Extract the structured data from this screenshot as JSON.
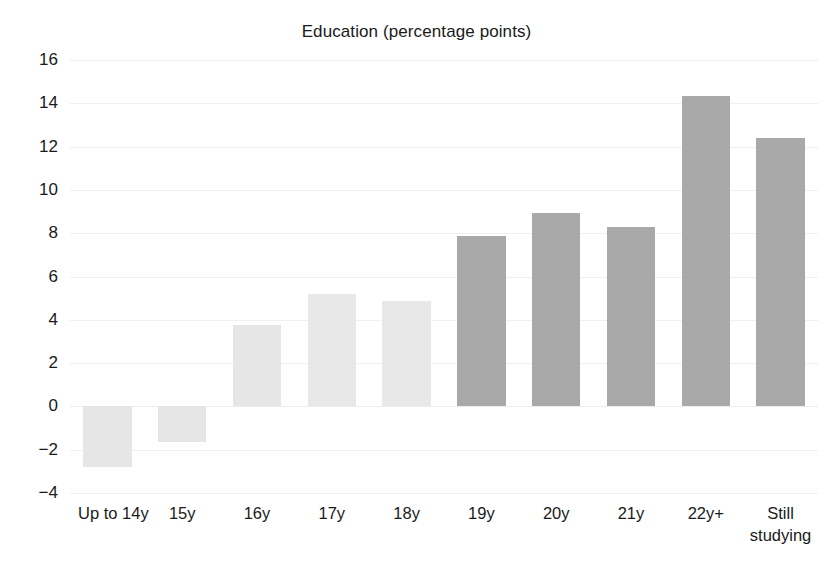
{
  "chart": {
    "title": "Education (percentage points)"
  },
  "axes": {
    "y_tick_labels": [
      "16",
      "14",
      "12",
      "10",
      "8",
      "6",
      "4",
      "2",
      "0",
      "−2",
      "−4"
    ]
  },
  "colors": {
    "bar_light": "#e6e6e6",
    "bar_dark": "#a9a9a9",
    "gridline": "#f0f0f0",
    "text": "#1a1a1a",
    "background": "#ffffff"
  },
  "chart_data": {
    "type": "bar",
    "title": "Education (percentage points)",
    "xlabel": "",
    "ylabel": "",
    "ylim": [
      -4,
      16
    ],
    "yticks": [
      -4,
      -2,
      0,
      2,
      4,
      6,
      8,
      10,
      12,
      14,
      16
    ],
    "grid": true,
    "legend": null,
    "categories": [
      "Up to 14y",
      "15y",
      "16y",
      "17y",
      "18y",
      "19y",
      "20y",
      "21y",
      "22y+",
      "Still studying"
    ],
    "values": [
      -2.8,
      -1.65,
      3.75,
      5.2,
      4.85,
      7.85,
      8.95,
      8.3,
      14.35,
      12.4
    ],
    "bar_colors": [
      "#e6e6e6",
      "#e6e6e6",
      "#e6e6e6",
      "#e8e8e8",
      "#e8e8e8",
      "#a9a9a9",
      "#a9a9a9",
      "#a9a9a9",
      "#a9a9a9",
      "#a9a9a9"
    ]
  }
}
